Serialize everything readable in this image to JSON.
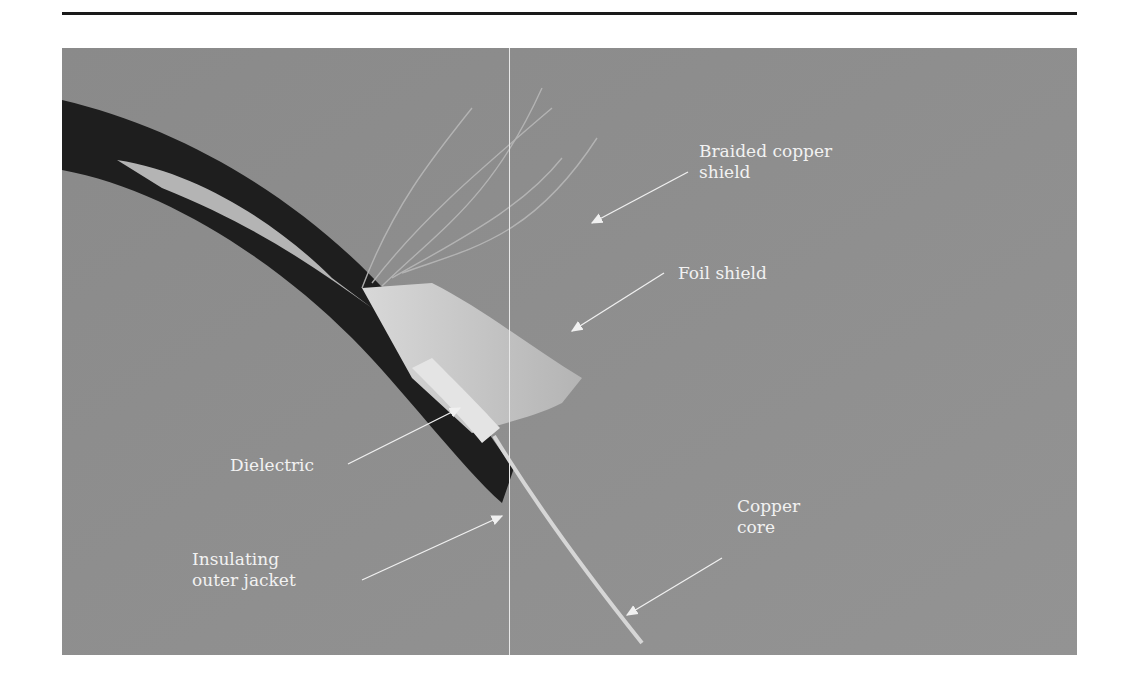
{
  "figure": {
    "labels": {
      "braided_shield": [
        "Braided copper",
        "shield"
      ],
      "foil_shield": "Foil shield",
      "dielectric": "Dielectric",
      "jacket": [
        "Insulating",
        "outer jacket"
      ],
      "core": [
        "Copper",
        "core"
      ]
    },
    "colors": {
      "background": "#8e8e8e",
      "jacket": "#1e1e1e",
      "foil": "#c8c8c8",
      "label_text": "#f2f2f2"
    }
  }
}
